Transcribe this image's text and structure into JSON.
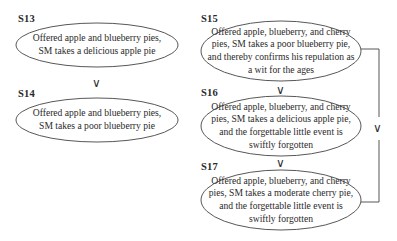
{
  "diagram": {
    "left_column": {
      "nodes": [
        {
          "id": "S13",
          "label": "S13",
          "lines": [
            "Offered apple and blueberry pies,",
            "SM takes a delicious apple pie"
          ]
        },
        {
          "id": "S14",
          "label": "S14",
          "lines": [
            "Offered apple and blueberry pies,",
            "SM takes a poor blueberry pie"
          ]
        }
      ],
      "relations": [
        {
          "from": "S13",
          "to": "S14",
          "symbol": "∨"
        }
      ]
    },
    "right_column": {
      "nodes": [
        {
          "id": "S15",
          "label": "S15",
          "lines": [
            "Offered apple, blueberry, and cherry",
            "pies, SM takes a poor blueberry pie,",
            "and thereby confirms his repulation as",
            "a wit for the ages"
          ]
        },
        {
          "id": "S16",
          "label": "S16",
          "lines": [
            "Offered apple, blueberry, and cherry",
            "pies, SM takes a delicious apple pie,",
            "and the forgettable little event is",
            "swiftly forgotten"
          ]
        },
        {
          "id": "S17",
          "label": "S17",
          "lines": [
            "Offered apple, blueberry, and cherry",
            "pies, SM takes a moderate cherry pie,",
            "and the forgettable little event is",
            "swiftly forgotten"
          ]
        }
      ],
      "relations": [
        {
          "from": "S15",
          "to": "S16",
          "symbol": "∨"
        },
        {
          "from": "S16",
          "to": "S17",
          "symbol": "∨"
        },
        {
          "from": "S15",
          "to": "S17",
          "symbol": "∨",
          "via": "bracket-connector"
        }
      ]
    },
    "colors": {
      "stroke": "#444444",
      "text": "#2a2a2a",
      "background": "#ffffff"
    }
  }
}
